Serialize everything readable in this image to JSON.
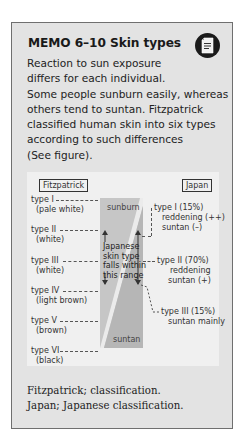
{
  "memo": {
    "title": "MEMO 6–10  Skin types",
    "icon": "document-icon",
    "body_lines": [
      "Reaction to sun exposure",
      "differs for each individual.",
      "Some people sunburn easily, whereas",
      "others tend to suntan. Fitzpatrick",
      "classified human skin into six types",
      "according to such differences",
      "(See figure)."
    ],
    "figure": {
      "left_header": "Fitzpatrick",
      "right_header": "Japan",
      "fitzpatrick_types": [
        {
          "name": "type I",
          "desc": "(pale white)"
        },
        {
          "name": "type II",
          "desc": "(white)"
        },
        {
          "name": "type III",
          "desc": "(white)"
        },
        {
          "name": "type IV",
          "desc": "(light brown)"
        },
        {
          "name": "type V",
          "desc": "(brown)"
        },
        {
          "name": "type VI",
          "desc": "(black)"
        }
      ],
      "zone_top": "sunburn",
      "zone_bottom": "suntan",
      "range_note": [
        "Japanese",
        "skin type",
        "falls within",
        "this range"
      ],
      "japan_types": [
        {
          "name": "type I (15%)",
          "line1": "reddening (++)",
          "line2": "suntan (–)"
        },
        {
          "name": "type II (70%)",
          "line1": "reddening",
          "line2": "suntan (+)"
        },
        {
          "name": "type III (15%)",
          "line1": "suntan mainly"
        }
      ]
    },
    "caption_lines": [
      "Fitzpatrick; classification.",
      "Japan; Japanese classification."
    ]
  }
}
